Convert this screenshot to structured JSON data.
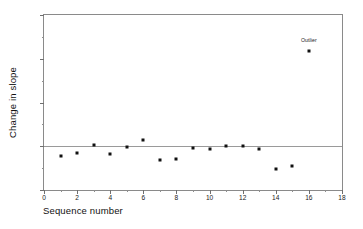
{
  "chart_data": {
    "type": "scatter",
    "title": "",
    "xlabel": "Sequence number",
    "ylabel": "Change in slope",
    "xlim": [
      0,
      18
    ],
    "ylim": [
      -0.1,
      0.3
    ],
    "grid": false,
    "legend": null,
    "x_major_ticks": [
      "0",
      "2",
      "4",
      "6",
      "8",
      "10",
      "12",
      "14",
      "16",
      "18"
    ],
    "x_major_values": [
      0,
      2,
      4,
      6,
      8,
      10,
      12,
      14,
      16,
      18
    ],
    "x_minor_values": [
      1,
      3,
      5,
      7,
      9,
      11,
      13,
      15,
      17
    ],
    "y_major_ticks": [
      "-.1",
      "0.0",
      ".1",
      ".2",
      ".3"
    ],
    "y_major_values": [
      -0.1,
      0.0,
      0.1,
      0.2,
      0.3
    ],
    "y_minor_values": [
      -0.05,
      0.05,
      0.15,
      0.25
    ],
    "reference_line_y": 0.0,
    "x": [
      1,
      2,
      3,
      4,
      5,
      6,
      7,
      8,
      9,
      10,
      11,
      12,
      13,
      14,
      15,
      16
    ],
    "y": [
      -0.022,
      -0.016,
      0.003,
      -0.018,
      -0.001,
      0.014,
      -0.031,
      -0.03,
      -0.005,
      -0.006,
      0.001,
      0.0,
      -0.007,
      -0.052,
      -0.045,
      0.218
    ],
    "annotations": [
      {
        "text": "Outlier",
        "x": 16,
        "y": 0.238
      }
    ]
  }
}
